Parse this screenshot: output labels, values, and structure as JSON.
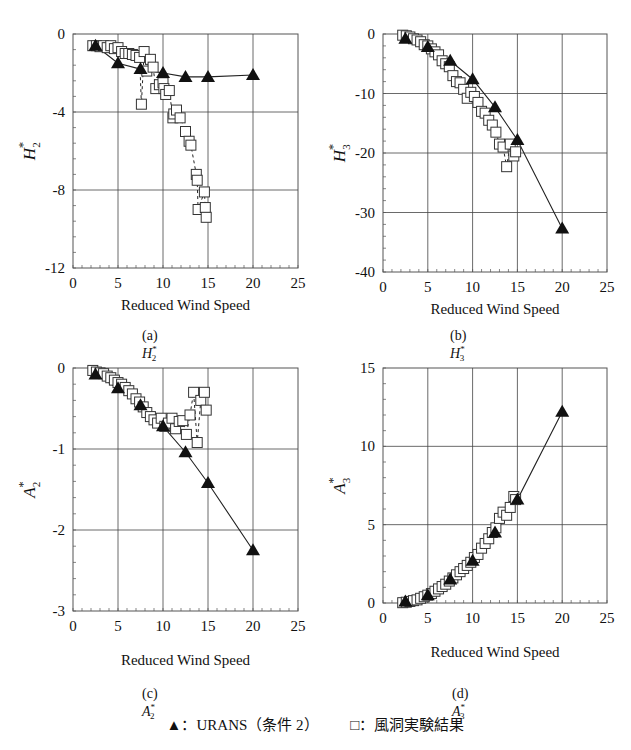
{
  "figure": {
    "legend": {
      "urans_symbol": "▲",
      "urans_label": "：URANS（条件 2）",
      "exp_symbol": "□",
      "exp_label": "：風洞実験結果"
    },
    "captions": {
      "a": {
        "prefix": "(a)",
        "sym": "H",
        "sub": "2",
        "sup": "*"
      },
      "b": {
        "prefix": "(b)",
        "sym": "H",
        "sub": "3",
        "sup": "*"
      },
      "c": {
        "prefix": "(c)",
        "sym": "A",
        "sub": "2",
        "sup": "*"
      },
      "d": {
        "prefix": "(d)",
        "sym": "A",
        "sub": "3",
        "sup": "*"
      }
    }
  },
  "chart_data": [
    {
      "id": "a",
      "type": "scatter",
      "title": "(a) H2*",
      "xlabel": "Reduced Wind Speed",
      "ylabel": "H2*",
      "xlim": [
        0,
        25
      ],
      "ylim": [
        -12,
        0
      ],
      "xticks": [
        0,
        5,
        10,
        15,
        20,
        25
      ],
      "yticks": [
        0,
        -4,
        -8,
        -12
      ],
      "grid": true,
      "series": [
        {
          "name": "URANS（条件 2）",
          "marker": "filled-triangle",
          "line": "solid",
          "x": [
            2.5,
            5,
            7.5,
            10,
            12.5,
            15,
            20
          ],
          "y": [
            -0.6,
            -1.5,
            -1.8,
            -2.0,
            -2.2,
            -2.2,
            -2.1
          ]
        },
        {
          "name": "風洞実験結果",
          "marker": "open-square",
          "line": "dashed",
          "x": [
            2.2,
            2.6,
            3.0,
            3.4,
            3.8,
            4.2,
            4.6,
            5.0,
            5.4,
            5.8,
            6.2,
            6.6,
            7.0,
            7.4,
            7.6,
            7.9,
            8.2,
            8.6,
            8.9,
            9.2,
            9.6,
            10.0,
            10.1,
            10.3,
            10.7,
            11.1,
            11.2,
            11.5,
            11.9,
            12.5,
            12.9,
            13.1,
            13.7,
            13.8,
            13.9,
            14.6,
            14.7,
            14.8
          ],
          "y": [
            -0.6,
            -0.6,
            -0.65,
            -0.6,
            -0.7,
            -0.6,
            -0.75,
            -0.7,
            -0.9,
            -1.0,
            -1.0,
            -1.05,
            -1.1,
            -1.2,
            -3.6,
            -0.9,
            -1.9,
            -1.3,
            -1.7,
            -2.8,
            -2.6,
            -2.5,
            -2.8,
            -3.1,
            -2.9,
            -4.3,
            -4.1,
            -3.9,
            -4.3,
            -5.0,
            -5.5,
            -5.7,
            -7.2,
            -7.5,
            -9.0,
            -8.1,
            -8.9,
            -9.4
          ]
        }
      ]
    },
    {
      "id": "b",
      "type": "scatter",
      "title": "(b) H3*",
      "xlabel": "Reduced Wind Speed",
      "ylabel": "H3*",
      "xlim": [
        0,
        25
      ],
      "ylim": [
        -40,
        0
      ],
      "xticks": [
        0,
        5,
        10,
        15,
        20,
        25
      ],
      "yticks": [
        0,
        -10,
        -20,
        -30,
        -40
      ],
      "grid": true,
      "series": [
        {
          "name": "URANS（条件 2）",
          "marker": "filled-triangle",
          "line": "solid",
          "x": [
            2.5,
            5,
            7.5,
            10,
            12.5,
            15,
            20
          ],
          "y": [
            -0.8,
            -2.2,
            -4.5,
            -7.6,
            -12.3,
            -17.8,
            -32.7
          ]
        },
        {
          "name": "風洞実験結果",
          "marker": "open-square",
          "line": "dashed",
          "x": [
            2.2,
            2.6,
            3.0,
            3.4,
            3.8,
            4.2,
            4.6,
            5.0,
            5.4,
            5.8,
            6.2,
            6.6,
            7.0,
            7.4,
            7.8,
            8.2,
            8.6,
            9.0,
            9.4,
            9.8,
            10.2,
            10.6,
            11.0,
            11.4,
            11.8,
            12.2,
            12.6,
            13.0,
            13.4,
            13.8,
            14.2,
            14.6,
            14.8
          ],
          "y": [
            -0.2,
            -0.3,
            -0.5,
            -0.8,
            -1.0,
            -1.3,
            -1.8,
            -2.0,
            -2.5,
            -3.0,
            -3.5,
            -4.5,
            -5.0,
            -5.5,
            -7.0,
            -8.0,
            -8.2,
            -9.3,
            -10.8,
            -9.8,
            -10.5,
            -11.5,
            -13.0,
            -13.3,
            -14.5,
            -15.3,
            -16.5,
            -18.5,
            -19.0,
            -22.3,
            -18.5,
            -20.5,
            -19.8
          ]
        }
      ]
    },
    {
      "id": "c",
      "type": "scatter",
      "title": "(c) A2*",
      "xlabel": "Reduced Wind Speed",
      "ylabel": "A2*",
      "xlim": [
        0,
        25
      ],
      "ylim": [
        -3,
        0
      ],
      "xticks": [
        0,
        5,
        10,
        15,
        20,
        25
      ],
      "yticks": [
        0,
        -1,
        -2,
        -3
      ],
      "grid": true,
      "series": [
        {
          "name": "URANS（条件 2）",
          "marker": "filled-triangle",
          "line": "solid",
          "x": [
            2.5,
            5,
            7.5,
            10,
            12.5,
            15,
            20
          ],
          "y": [
            -0.08,
            -0.25,
            -0.46,
            -0.72,
            -1.04,
            -1.42,
            -2.25
          ]
        },
        {
          "name": "風洞実験結果",
          "marker": "open-square",
          "line": "dashed",
          "x": [
            2.2,
            2.6,
            3.0,
            3.4,
            3.8,
            4.2,
            4.6,
            5.0,
            5.4,
            5.8,
            6.2,
            6.6,
            7.0,
            7.4,
            7.8,
            8.2,
            8.6,
            9.0,
            9.4,
            9.8,
            10.2,
            10.6,
            11.0,
            11.4,
            11.8,
            12.2,
            12.6,
            13.0,
            13.4,
            13.8,
            14.2,
            14.6,
            14.8
          ],
          "y": [
            -0.03,
            -0.05,
            -0.06,
            -0.07,
            -0.1,
            -0.12,
            -0.15,
            -0.18,
            -0.2,
            -0.24,
            -0.28,
            -0.32,
            -0.38,
            -0.42,
            -0.48,
            -0.55,
            -0.6,
            -0.64,
            -0.68,
            -0.62,
            -0.72,
            -0.68,
            -0.62,
            -0.75,
            -0.66,
            -0.65,
            -0.82,
            -0.58,
            -0.3,
            -0.92,
            -0.4,
            -0.3,
            -0.52
          ]
        }
      ]
    },
    {
      "id": "d",
      "type": "scatter",
      "title": "(d) A3*",
      "xlabel": "Reduced Wind Speed",
      "ylabel": "A3*",
      "xlim": [
        0,
        25
      ],
      "ylim": [
        0,
        15
      ],
      "xticks": [
        0,
        5,
        10,
        15,
        20,
        25
      ],
      "yticks": [
        0,
        5,
        10,
        15
      ],
      "grid": true,
      "series": [
        {
          "name": "URANS（条件 2）",
          "marker": "filled-triangle",
          "line": "solid",
          "x": [
            2.5,
            5,
            7.5,
            10,
            12.5,
            15,
            20
          ],
          "y": [
            0.1,
            0.5,
            1.5,
            2.7,
            4.5,
            6.6,
            12.2
          ]
        },
        {
          "name": "風洞実験結果",
          "marker": "open-square",
          "line": "dashed",
          "x": [
            2.2,
            2.6,
            3.0,
            3.4,
            3.8,
            4.2,
            4.6,
            5.0,
            5.4,
            5.8,
            6.2,
            6.6,
            7.0,
            7.4,
            7.8,
            8.2,
            8.6,
            9.0,
            9.4,
            9.8,
            10.2,
            10.6,
            11.0,
            11.4,
            11.8,
            12.2,
            12.6,
            13.0,
            13.4,
            13.8,
            14.2,
            14.6,
            14.8
          ],
          "y": [
            0.02,
            0.05,
            0.1,
            0.15,
            0.2,
            0.3,
            0.4,
            0.5,
            0.6,
            0.75,
            0.9,
            1.05,
            1.2,
            1.4,
            1.6,
            1.8,
            2.0,
            2.2,
            2.4,
            2.6,
            2.9,
            3.1,
            3.5,
            3.8,
            4.1,
            4.5,
            4.8,
            5.4,
            5.8,
            5.6,
            6.1,
            6.8,
            6.6
          ]
        }
      ]
    }
  ]
}
